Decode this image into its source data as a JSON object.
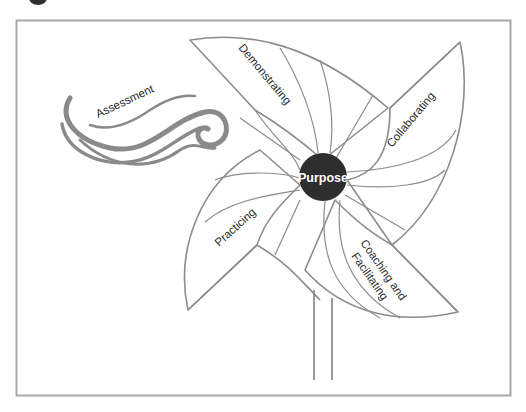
{
  "diagram": {
    "type": "pinwheel",
    "center": {
      "label": "Purpose",
      "color": "#2e2e2e",
      "text_color": "#ffffff"
    },
    "blades": [
      {
        "id": "top",
        "label": "Demonstrating"
      },
      {
        "id": "right",
        "label": "Collaborating"
      },
      {
        "id": "lower-right",
        "label_line1": "Coaching and",
        "label_line2": "Facilitating"
      },
      {
        "id": "left",
        "label": "Practicing"
      }
    ],
    "wind": {
      "label": "Assessment",
      "color": "#8a8a8a"
    },
    "colors": {
      "frame": "#a8a8a8",
      "outline": "#8c8c8c",
      "background": "#ffffff",
      "text": "#2a2a2a"
    }
  }
}
